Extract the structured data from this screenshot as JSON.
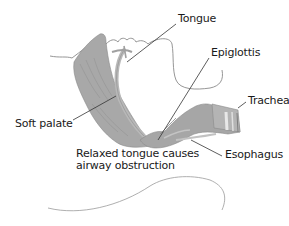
{
  "diagram": {
    "title": "Relaxed tongue causes airway obstruction",
    "caption_lines": [
      "Relaxed tongue causes",
      "airway obstruction"
    ],
    "labels": {
      "tongue": "Tongue",
      "epiglottis": "Epiglottis",
      "trachea": "Trachea",
      "soft_palate": "Soft palate",
      "esophagus": "Esophagus"
    },
    "colors": {
      "tissue": "#a9a9a9",
      "tissue_dark": "#8c8c8c",
      "tissue_light": "#c8c8c8",
      "outline": "#7a7a7a",
      "leader": "#333333",
      "text": "#1a1a1a",
      "background": "#ffffff"
    }
  }
}
